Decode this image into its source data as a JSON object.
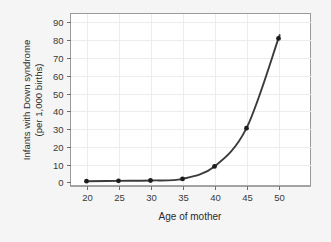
{
  "chart_data": {
    "type": "line",
    "title": "",
    "xlabel": "Age of mother",
    "ylabel_line1": "Infants with Down syndrome",
    "ylabel_line2": "(per 1,000 births)",
    "ylabel": "Infants with Down syndrome (per 1,000 births)",
    "x": [
      20,
      25,
      30,
      35,
      40,
      45,
      50
    ],
    "values": [
      0.7,
      0.9,
      1.1,
      2.0,
      9.0,
      30.5,
      81.0
    ],
    "series": [
      {
        "name": "Down syndrome incidence",
        "values": [
          0.7,
          0.9,
          1.1,
          2.0,
          9.0,
          30.5,
          81.0
        ]
      }
    ],
    "xticks": [
      20,
      25,
      30,
      35,
      40,
      45,
      50
    ],
    "xtick_labels": [
      "20",
      "25",
      "30",
      "35",
      "40",
      "45",
      "50"
    ],
    "yticks": [
      0,
      10,
      20,
      30,
      40,
      50,
      60,
      70,
      80,
      90
    ],
    "ytick_labels": [
      "0",
      "10",
      "20",
      "30",
      "40",
      "50",
      "60",
      "70",
      "80",
      "90"
    ],
    "xlim": [
      17.5,
      55
    ],
    "ylim": [
      -2,
      95
    ],
    "grid": true,
    "legend": false,
    "legend_position": "none",
    "marker": "circle",
    "curve_color": "#3b3b3b",
    "marker_color": "#1c1c1c",
    "grid_color": "#ececec",
    "plot_background": "#ffffff",
    "figure_background": "#f5f5f5",
    "frame_color": "#9a9a9a"
  }
}
